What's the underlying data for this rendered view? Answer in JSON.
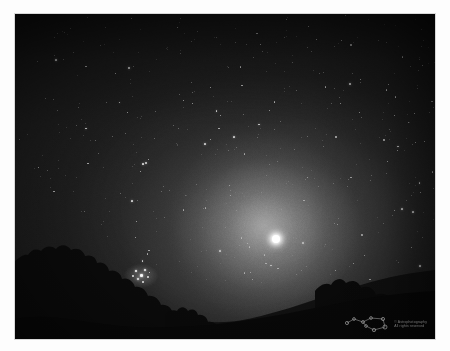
{
  "photo": {
    "title": "Night sky with bright star and zodiacal glow over treeline",
    "scene_type": "astrophotograph",
    "sky": {
      "base_color": "#202020",
      "glow_color": "#8c8c8c",
      "vignette_color": "#000000",
      "glow_center_label": "59% 65%"
    },
    "main_star": {
      "name": "bright-star",
      "x": 261,
      "y": 225,
      "color": "#ffffff",
      "note": "brightest object, centered lower-right of frame"
    },
    "star_cluster": {
      "name": "open-cluster",
      "x": 126,
      "y": 262,
      "color": "#e6e6e6",
      "note": "small fuzzy cluster above the left treeline"
    },
    "horizon": {
      "silhouette_color": "#0d0d0d",
      "description": "dark tree and hill silhouettes along the bottom"
    },
    "frame": {
      "page_background": "#fdfdfd",
      "border_color": "#d8d8d8",
      "left": 15,
      "top": 14,
      "width": 420,
      "height": 325
    }
  },
  "watermark": {
    "logo_name": "constellation-logo",
    "logo_color": "#b4b4b4",
    "line1": "© Astrophotography",
    "line2": "All rights reserved"
  },
  "stars": {
    "field_count": 520,
    "color_bright": "#f2f2f2",
    "color_dim": "#bdbdbd"
  }
}
